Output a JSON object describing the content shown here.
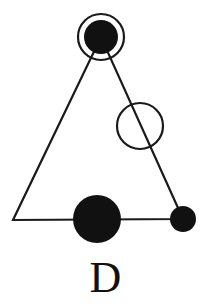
{
  "figure": {
    "label": "D",
    "stroke_color": "#1a1a1a",
    "fill_color": "#111111",
    "background_color": "#ffffff",
    "stroke_width": 2.2,
    "triangle": {
      "name": "triangle-outline",
      "apex": {
        "x": 101,
        "y": 37
      },
      "bottom_left": {
        "x": 13,
        "y": 220
      },
      "bottom_right": {
        "x": 183,
        "y": 219
      }
    },
    "nodes": [
      {
        "name": "apex-filled-circle",
        "style": "filled",
        "cx": 101,
        "cy": 37,
        "r": 17
      },
      {
        "name": "apex-open-ring",
        "style": "open",
        "cx": 101,
        "cy": 37,
        "r": 23
      },
      {
        "name": "right-edge-open-circle",
        "style": "open",
        "cx": 140,
        "cy": 126,
        "r": 23
      },
      {
        "name": "bottom-large-filled-circle",
        "style": "filled",
        "cx": 97,
        "cy": 219,
        "r": 24
      },
      {
        "name": "bottom-right-small-filled-circle",
        "style": "filled",
        "cx": 183,
        "cy": 219,
        "r": 13
      }
    ]
  }
}
